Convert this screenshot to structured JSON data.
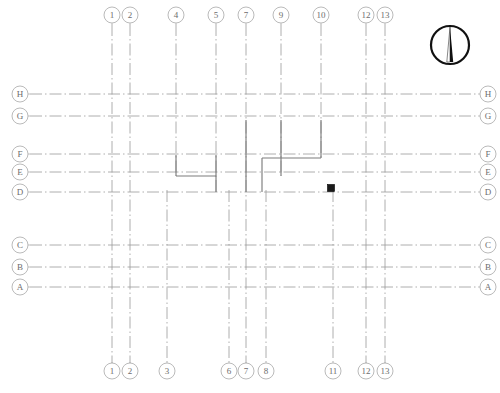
{
  "drawing": {
    "type": "structural-column-grid-plan",
    "title": "Column Grid Plan",
    "background_color": "#ffffff",
    "line_color": "#9a9a9a",
    "wall_color": "#7d7d7d",
    "bubble_text_color": "#6d6d6d",
    "marker_color": "#1a1a1a",
    "canvas": {
      "width": 500,
      "height": 393
    }
  },
  "north_arrow": {
    "name": "north-arrow",
    "cx": 450,
    "cy": 45,
    "r": 19,
    "label": ""
  },
  "column_grid_top": [
    {
      "label": "1",
      "x": 112,
      "cy": 15,
      "line_top": 24,
      "line_bottom": 370
    },
    {
      "label": "2",
      "x": 130,
      "cy": 15,
      "line_top": 24,
      "line_bottom": 370
    },
    {
      "label": "4",
      "x": 176,
      "cy": 15,
      "line_top": 24,
      "line_bottom": 176
    },
    {
      "label": "5",
      "x": 216,
      "cy": 15,
      "line_top": 24,
      "line_bottom": 192
    },
    {
      "label": "7",
      "x": 246,
      "cy": 15,
      "line_top": 24,
      "line_bottom": 370
    },
    {
      "label": "9",
      "x": 281,
      "cy": 15,
      "line_top": 24,
      "line_bottom": 176
    },
    {
      "label": "10",
      "x": 321,
      "cy": 15,
      "line_top": 24,
      "line_bottom": 160
    },
    {
      "label": "12",
      "x": 366,
      "cy": 15,
      "line_top": 24,
      "line_bottom": 370
    },
    {
      "label": "13",
      "x": 385,
      "cy": 15,
      "line_top": 24,
      "line_bottom": 370
    }
  ],
  "column_grid_bottom": [
    {
      "label": "1",
      "x": 112,
      "cy": 371
    },
    {
      "label": "2",
      "x": 130,
      "cy": 371
    },
    {
      "label": "3",
      "x": 167,
      "cy": 371,
      "line_top": 190,
      "line_bottom": 362
    },
    {
      "label": "6",
      "x": 229,
      "cy": 371,
      "line_top": 190,
      "line_bottom": 362
    },
    {
      "label": "7",
      "x": 246,
      "cy": 371
    },
    {
      "label": "8",
      "x": 266,
      "cy": 371,
      "line_top": 190,
      "line_bottom": 362
    },
    {
      "label": "11",
      "x": 333,
      "cy": 371,
      "line_top": 190,
      "line_bottom": 362
    },
    {
      "label": "12",
      "x": 366,
      "cy": 371
    },
    {
      "label": "13",
      "x": 385,
      "cy": 371
    }
  ],
  "row_grid_left": [
    {
      "label": "H",
      "y": 94,
      "cx": 20,
      "line_left": 30,
      "line_right": 478
    },
    {
      "label": "G",
      "y": 116,
      "cx": 20,
      "line_left": 30,
      "line_right": 478
    },
    {
      "label": "F",
      "y": 154,
      "cx": 20,
      "line_left": 30,
      "line_right": 478
    },
    {
      "label": "E",
      "y": 172,
      "cx": 20,
      "line_left": 30,
      "line_right": 478
    },
    {
      "label": "D",
      "y": 192,
      "cx": 20,
      "line_left": 30,
      "line_right": 478
    },
    {
      "label": "C",
      "y": 245,
      "cx": 20,
      "line_left": 30,
      "line_right": 478
    },
    {
      "label": "B",
      "y": 267,
      "cx": 20,
      "line_left": 30,
      "line_right": 478
    },
    {
      "label": "A",
      "y": 287,
      "cx": 20,
      "line_left": 30,
      "line_right": 478
    }
  ],
  "row_grid_right": [
    {
      "label": "H",
      "y": 94,
      "cx": 488
    },
    {
      "label": "G",
      "y": 116,
      "cx": 488
    },
    {
      "label": "F",
      "y": 154,
      "cx": 488
    },
    {
      "label": "E",
      "y": 172,
      "cx": 488
    },
    {
      "label": "D",
      "y": 192,
      "cx": 488
    },
    {
      "label": "C",
      "y": 245,
      "cx": 488
    },
    {
      "label": "B",
      "y": 267,
      "cx": 488
    },
    {
      "label": "A",
      "y": 287,
      "cx": 488
    }
  ],
  "wall_segments": [
    {
      "x1": 176,
      "y1": 155,
      "x2": 176,
      "y2": 176
    },
    {
      "x1": 176,
      "y1": 176,
      "x2": 216,
      "y2": 176
    },
    {
      "x1": 216,
      "y1": 155,
      "x2": 216,
      "y2": 192
    },
    {
      "x1": 246,
      "y1": 120,
      "x2": 246,
      "y2": 192
    },
    {
      "x1": 281,
      "y1": 120,
      "x2": 281,
      "y2": 176
    },
    {
      "x1": 262,
      "y1": 158,
      "x2": 321,
      "y2": 158
    },
    {
      "x1": 321,
      "y1": 120,
      "x2": 321,
      "y2": 158
    },
    {
      "x1": 262,
      "y1": 158,
      "x2": 262,
      "y2": 192
    }
  ],
  "markers": [
    {
      "name": "column-marker",
      "x": 331,
      "y": 188,
      "size": 7,
      "shape": "square"
    }
  ],
  "bubble_radius": 8
}
